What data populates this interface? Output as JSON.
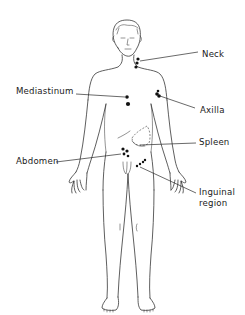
{
  "diagram": {
    "labels": {
      "neck": "Neck",
      "mediastinum": "Mediastinum",
      "axilla": "Axilla",
      "spleen": "Spleen",
      "abdomen": "Abdomen",
      "inguinal_line1": "Inguinal",
      "inguinal_line2": "region"
    },
    "colors": {
      "line": "#2a2a2a",
      "node": "#111111",
      "background": "#ffffff"
    }
  }
}
